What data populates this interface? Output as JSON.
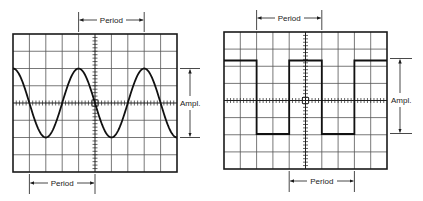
{
  "figure": {
    "left_scope": {
      "waveform": "sine",
      "period_label_top": "Period",
      "period_label_bottom": "Period",
      "amplitude_label": "Ampl.",
      "grid": {
        "columns": 10,
        "rows": 8
      }
    },
    "right_scope": {
      "waveform": "square",
      "period_label_top": "Period",
      "period_label_bottom": "Period",
      "amplitude_label": "Ampl.",
      "grid": {
        "columns": 10,
        "rows": 8
      }
    },
    "colors": {
      "ink": "#1a1a1a",
      "grid": "#555555",
      "background": "#ffffff"
    }
  }
}
